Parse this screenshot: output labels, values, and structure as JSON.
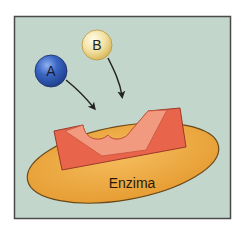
{
  "diagram": {
    "title": "",
    "frame": {
      "background": "#c2d6cc",
      "border": "#4a4a4a"
    },
    "substrates": [
      {
        "id": "A",
        "label": "A",
        "color": "#3a66c4",
        "highlight": "#7aa0e6",
        "shade": "#1f3f8c"
      },
      {
        "id": "B",
        "label": "B",
        "color": "#f0dc9c",
        "highlight": "#fbf2cc",
        "shade": "#d9b85a"
      }
    ],
    "enzyme": {
      "label": "Enzima",
      "ellipse_color": "#eea944",
      "ellipse_edge": "#6b4a1a",
      "active_site_outer": "#e8644a",
      "active_site_inner": "#f29a80",
      "active_site_edge": "#9a3a2a"
    },
    "arrows": [
      {
        "from": "A",
        "to": "active-site-left"
      },
      {
        "from": "B",
        "to": "active-site-right"
      }
    ]
  }
}
